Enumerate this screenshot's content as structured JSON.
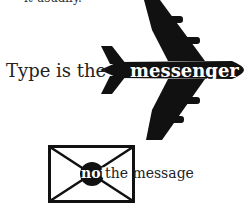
{
  "top_fragment": "it usually.",
  "headline": {
    "lead": "Type is the",
    "highlight": "messenger"
  },
  "footer_line": {
    "highlight": "not",
    "rest": "the message"
  },
  "icons": {
    "plane": "airplane-icon",
    "envelope": "envelope-icon"
  },
  "colors": {
    "ink": "#111111",
    "background": "#ffffff"
  }
}
